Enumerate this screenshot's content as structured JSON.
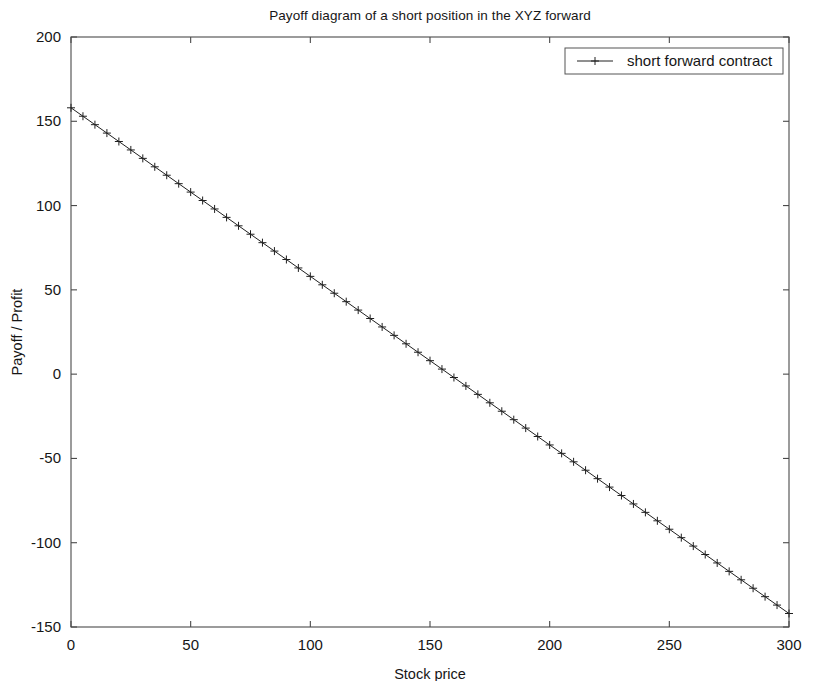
{
  "figure": {
    "width": 822,
    "height": 681,
    "background": "#ffffff",
    "foreground": "#161616"
  },
  "chart_data": {
    "type": "line",
    "title": "Payoff diagram of a short position in the XYZ forward",
    "xlabel": "Stock price",
    "ylabel": "Payoff / Profit",
    "xlim": [
      0,
      300
    ],
    "ylim": [
      -150,
      200
    ],
    "xticks": [
      0,
      50,
      100,
      150,
      200,
      250,
      300
    ],
    "xtick_labels": [
      "0",
      "50",
      "100",
      "150",
      "200",
      "250",
      "300"
    ],
    "yticks": [
      -150,
      -100,
      -50,
      0,
      50,
      100,
      150,
      200
    ],
    "ytick_labels": [
      "-150",
      "-100",
      "-50",
      "0",
      "50",
      "100",
      "150",
      "200"
    ],
    "grid": false,
    "legend_position": "upper right",
    "legend_entries": [
      "short forward contract"
    ],
    "marker": "+",
    "line_color": "#202020",
    "series": [
      {
        "name": "short forward contract",
        "forward_price": 158,
        "slope": -1.0,
        "x": [
          0,
          5,
          10,
          15,
          20,
          25,
          30,
          35,
          40,
          45,
          50,
          55,
          60,
          65,
          70,
          75,
          80,
          85,
          90,
          95,
          100,
          105,
          110,
          115,
          120,
          125,
          130,
          135,
          140,
          145,
          150,
          155,
          160,
          165,
          170,
          175,
          180,
          185,
          190,
          195,
          200,
          205,
          210,
          215,
          220,
          225,
          230,
          235,
          240,
          245,
          250,
          255,
          260,
          265,
          270,
          275,
          280,
          285,
          290,
          295,
          300
        ],
        "values": [
          158,
          153,
          148,
          143,
          138,
          133,
          128,
          123,
          118,
          113,
          108,
          103,
          98,
          93,
          88,
          83,
          78,
          73,
          68,
          63,
          58,
          53,
          48,
          43,
          38,
          33,
          28,
          23,
          18,
          13,
          8,
          3,
          -2,
          -7,
          -12,
          -17,
          -22,
          -27,
          -32,
          -37,
          -42,
          -47,
          -52,
          -57,
          -62,
          -67,
          -72,
          -77,
          -82,
          -87,
          -92,
          -97,
          -102,
          -107,
          -112,
          -117,
          -122,
          -127,
          -132,
          -137,
          -142
        ]
      }
    ]
  }
}
